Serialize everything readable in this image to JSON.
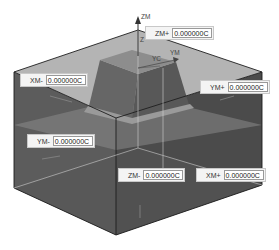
{
  "viewport": {
    "description": "3D CAD bounding-block view with draggable handles",
    "colors": {
      "top_face": "#b0b0b0",
      "side_face_left": "#5a5a5a",
      "side_face_right": "#4a4a4a",
      "part": "#6e6e6e",
      "edge": "#222222"
    }
  },
  "axes": {
    "zm": "ZM",
    "ym": "YM",
    "yc": "YC",
    "zc": "Z"
  },
  "fields": [
    {
      "id": "zm-plus",
      "label": "ZM+",
      "value": "0.000000C"
    },
    {
      "id": "xm-minus",
      "label": "XM-",
      "value": "0.000000C"
    },
    {
      "id": "ym-plus",
      "label": "YM+",
      "value": "0.000000C"
    },
    {
      "id": "ym-minus",
      "label": "YM-",
      "value": "0.000000C"
    },
    {
      "id": "zm-minus",
      "label": "ZM-",
      "value": "0.000000C"
    },
    {
      "id": "xm-plus",
      "label": "XM+",
      "value": "0.000000C"
    }
  ]
}
